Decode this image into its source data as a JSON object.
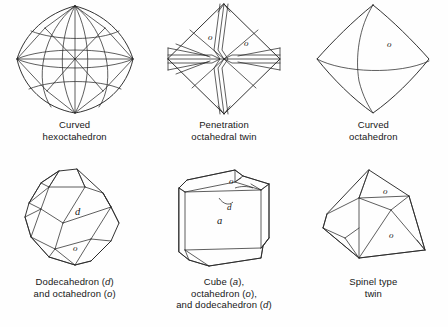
{
  "plate": {
    "title": "Crystal forms of diamond",
    "background_color": "#fefefe",
    "line_color": "#1c1c1c"
  },
  "figures": [
    {
      "id": "curved-hexoctahedron",
      "caption_lines": [
        "Curved",
        "hexoctahedron"
      ],
      "caption_plain": "Curved hexoctahedron",
      "face_labels": []
    },
    {
      "id": "penetration-octahedral-twin",
      "caption_lines": [
        "Penetration",
        "octahedral twin"
      ],
      "caption_plain": "Penetration octahedral twin",
      "face_labels": [
        "o",
        "o"
      ]
    },
    {
      "id": "curved-octahedron",
      "caption_lines": [
        "Curved",
        "octahedron"
      ],
      "caption_plain": "Curved octahedron",
      "face_labels": [
        "o"
      ]
    },
    {
      "id": "dodecahedron-and-octahedron",
      "caption_lines": [
        "Dodecahedron (d)",
        "and octahedron (o)"
      ],
      "caption_plain": "Dodecahedron (d) and octahedron (o)",
      "caption_segments": [
        [
          "Dodecahedron (",
          "d",
          ")"
        ],
        [
          "and octahedron (",
          "o",
          ")"
        ]
      ],
      "face_labels": [
        "d",
        "o"
      ]
    },
    {
      "id": "cube-octahedron-dodecahedron",
      "caption_lines": [
        "Cube (a),",
        "octahedron (o),",
        "and dodecahedron (d)"
      ],
      "caption_plain": "Cube (a), octahedron (o), and dodecahedron (d)",
      "caption_segments": [
        [
          "Cube (",
          "a",
          "),"
        ],
        [
          "octahedron (",
          "o",
          "),"
        ],
        [
          "and dodecahedron (",
          "d",
          ")"
        ]
      ],
      "face_labels": [
        "o",
        "d",
        "a"
      ]
    },
    {
      "id": "spinel-type-twin",
      "caption_lines": [
        "Spinel type",
        "twin"
      ],
      "caption_plain": "Spinel type twin",
      "face_labels": [
        "o",
        "o"
      ]
    }
  ]
}
